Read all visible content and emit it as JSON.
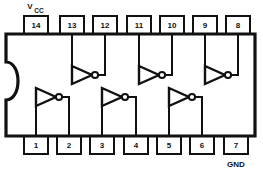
{
  "figure": {
    "package": {
      "notch": "semicircular key notch on left edge",
      "outline_color": "#111111",
      "fill_color": "#ffffff"
    },
    "rails": {
      "vcc": {
        "base": "V",
        "subscript": "CC",
        "pin": "14"
      },
      "gnd": {
        "label": "GND",
        "pin": "7"
      }
    },
    "pins_top": [
      {
        "number": "14",
        "x": 36
      },
      {
        "number": "13",
        "x": 72
      },
      {
        "number": "12",
        "x": 105
      },
      {
        "number": "11",
        "x": 139
      },
      {
        "number": "10",
        "x": 172
      },
      {
        "number": "9",
        "x": 205
      },
      {
        "number": "8",
        "x": 238
      }
    ],
    "pins_bottom": [
      {
        "number": "1",
        "x": 36
      },
      {
        "number": "2",
        "x": 69
      },
      {
        "number": "3",
        "x": 102
      },
      {
        "number": "4",
        "x": 136
      },
      {
        "number": "5",
        "x": 169
      },
      {
        "number": "6",
        "x": 202
      },
      {
        "number": "7",
        "x": 236
      }
    ],
    "gates": [
      {
        "name": "inverter-1",
        "row": "bottom",
        "input_pin": "1",
        "output_pin": "2"
      },
      {
        "name": "inverter-2",
        "row": "bottom",
        "input_pin": "3",
        "output_pin": "4"
      },
      {
        "name": "inverter-3",
        "row": "bottom",
        "input_pin": "5",
        "output_pin": "6"
      },
      {
        "name": "inverter-4",
        "row": "top",
        "input_pin": "13",
        "output_pin": "12"
      },
      {
        "name": "inverter-5",
        "row": "top",
        "input_pin": "11",
        "output_pin": "10"
      },
      {
        "name": "inverter-6",
        "row": "top",
        "input_pin": "9",
        "output_pin": "8"
      }
    ]
  }
}
